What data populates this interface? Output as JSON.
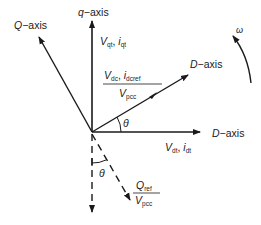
{
  "diagram": {
    "type": "vector-phasor-diagram",
    "colors": {
      "stroke": "#1a1a1a",
      "background": "#ffffff"
    },
    "axes": {
      "q_axis": {
        "prefix": "q",
        "suffix": "−axis"
      },
      "Q_axis": {
        "prefix": "Q",
        "suffix": "−axis"
      },
      "D_axis_rotated": {
        "prefix": "D",
        "suffix": "−axis"
      },
      "D_axis_horizontal": {
        "prefix": "D",
        "suffix": "−axis"
      }
    },
    "vectors": {
      "vqt_iqt": {
        "v": "V",
        "v_sub": "qt",
        "sep": ", ",
        "i": "i",
        "i_sub": "qt"
      },
      "vdt_idt": {
        "v": "V",
        "v_sub": "dt",
        "sep": ", ",
        "i": "i",
        "i_sub": "dt"
      },
      "dc_fraction": {
        "num_v": "V",
        "num_v_sub": "dc",
        "sep": ", ",
        "num_i": "i",
        "num_i_sub": "dcref",
        "den": "V",
        "den_sub": "pcc"
      },
      "q_fraction": {
        "num": "Q",
        "num_sub": "ref",
        "den": "V",
        "den_sub": "pcc"
      }
    },
    "angles": {
      "theta_upper": "θ",
      "theta_lower": "θ"
    },
    "rotation": {
      "omega": "ω"
    }
  }
}
